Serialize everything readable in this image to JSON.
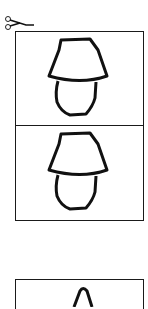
{
  "sheet": {
    "title": "Lamp drawing cut-out cards",
    "cut_icon": "scissors-icon",
    "stroke_color": "#111111",
    "border_color": "#1a1a1a",
    "background": "#ffffff"
  },
  "cards": [
    {
      "label": "Lamp drawing card 1",
      "icon": "lamp-icon"
    },
    {
      "label": "Lamp drawing card 2",
      "icon": "lamp-icon"
    },
    {
      "label": "Lamp drawing card 3 (partially visible)",
      "icon": "lamp-shade-icon"
    }
  ]
}
